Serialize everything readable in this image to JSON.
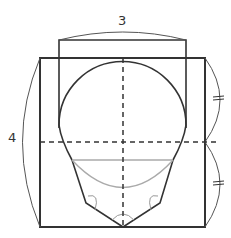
{
  "labels": {
    "top_dimension": "3",
    "left_dimension": "4"
  },
  "colors": {
    "stroke": "#333333",
    "grey": "#aaaaaa",
    "thin": "#555555"
  },
  "markers": {
    "equal_tick_upper": "=",
    "equal_tick_lower": "="
  }
}
